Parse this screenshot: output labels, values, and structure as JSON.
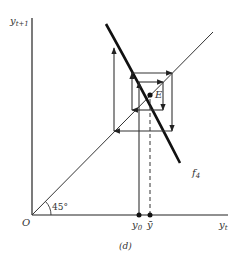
{
  "figure": {
    "caption": "(d)",
    "y_axis_label": {
      "main": "y",
      "sub": "t+1"
    },
    "x_axis_label": {
      "main": "y",
      "sub": "t"
    },
    "origin_label": "O",
    "angle_label": "45°",
    "equilibrium_label": "E",
    "curve_label": {
      "main": "f",
      "sub": "4"
    },
    "x_ticks": [
      {
        "main": "y",
        "sub": "0"
      },
      {
        "main": "ȳ",
        "sub": ""
      }
    ]
  },
  "colors": {
    "ink": "#111111",
    "thin": "#444444"
  }
}
